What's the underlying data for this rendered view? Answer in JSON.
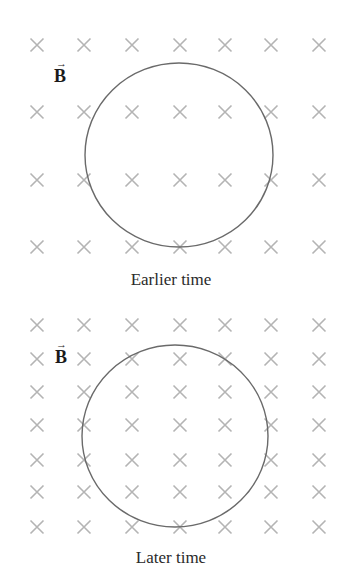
{
  "figure": {
    "x_columns": [
      37,
      84,
      132,
      180,
      225,
      271,
      319
    ],
    "colors": {
      "field_mark": "#b4b4b4",
      "loop": "#6a6a6a",
      "text": "#2a2a2a"
    }
  },
  "panels": [
    {
      "id": "earlier",
      "caption": "Earlier time",
      "field_label": "B",
      "field_label_arrow": "→",
      "rows_y": [
        45,
        112,
        180,
        247
      ],
      "loop": {
        "cx": 179,
        "cy": 155,
        "rx": 94,
        "ry": 92
      },
      "label_pos": {
        "x": 54,
        "y": 66
      },
      "caption_y": 270
    },
    {
      "id": "later",
      "caption": "Later time",
      "field_label": "B",
      "field_label_arrow": "→",
      "rows_y": [
        325,
        359,
        392,
        425,
        460,
        492,
        527
      ],
      "loop": {
        "cx": 175,
        "cy": 436,
        "rx": 93,
        "ry": 91
      },
      "label_pos": {
        "x": 54,
        "y": 347
      },
      "caption_y": 548
    }
  ]
}
